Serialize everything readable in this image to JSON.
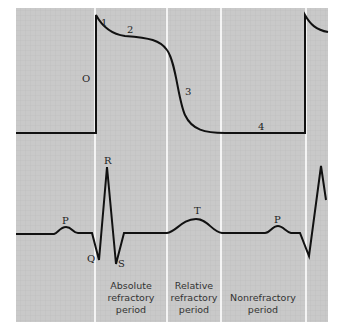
{
  "figure": {
    "background_color": "#c8c8c8",
    "grid_color": "#b9b9b9",
    "trace_color": "#111111",
    "separator_color": "#ffffff"
  },
  "action_potential": {
    "phase_labels": [
      "O",
      "1",
      "2",
      "3",
      "4"
    ]
  },
  "ecg": {
    "wave_labels": {
      "p1": "P",
      "q": "Q",
      "r": "R",
      "s": "S",
      "t": "T",
      "p2": "P"
    }
  },
  "periods": [
    {
      "line1": "Absolute",
      "line2": "refractory",
      "line3": "period"
    },
    {
      "line1": "Relative",
      "line2": "refractory",
      "line3": "period"
    },
    {
      "line1": "Nonrefractory",
      "line2": "period",
      "line3": ""
    }
  ]
}
